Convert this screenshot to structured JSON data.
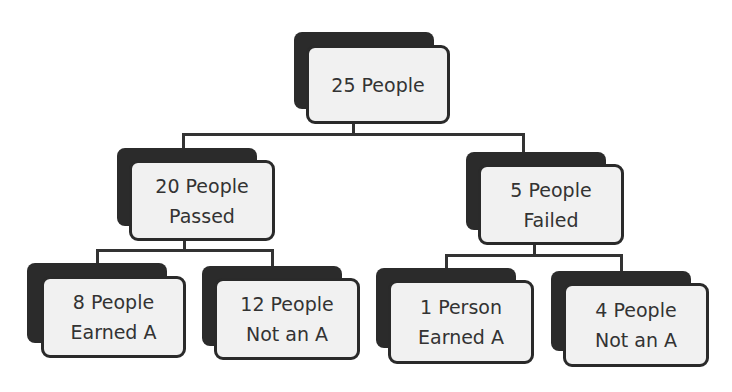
{
  "diagram": {
    "root": {
      "line1": "25 People",
      "line2": ""
    },
    "level1": [
      {
        "line1": "20 People",
        "line2": "Passed"
      },
      {
        "line1": "5 People",
        "line2": "Failed"
      }
    ],
    "level2": [
      {
        "line1": "8 People",
        "line2": "Earned A"
      },
      {
        "line1": "12 People",
        "line2": "Not an A"
      },
      {
        "line1": "1 Person",
        "line2": "Earned A"
      },
      {
        "line1": "4 People",
        "line2": "Not an A"
      }
    ]
  },
  "colors": {
    "shadow": "#2b2b2b",
    "box_fill": "#f1f1f1",
    "border": "#2a2a2a",
    "text": "#333333"
  }
}
